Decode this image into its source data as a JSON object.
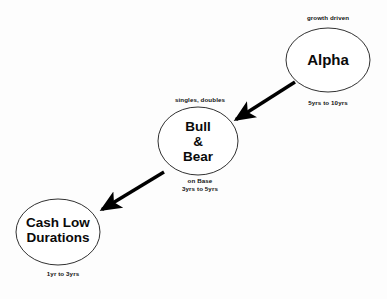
{
  "diagram": {
    "background_color": "#fdfdfd",
    "node_fill": "#ffffff",
    "node_stroke": "#1a1a1a",
    "edge_color": "#000000",
    "nodes": [
      {
        "id": "alpha",
        "label": "Alpha",
        "caption_above": "growth driven",
        "caption_below": "5yrs to 10yrs",
        "cx": 328,
        "cy": 60,
        "rx": 42,
        "ry": 32
      },
      {
        "id": "bull-bear",
        "label_line1": "Bull",
        "label_line2": "&",
        "label_line3": "Bear",
        "caption_above": "singles, doubles",
        "caption_below_line1": "on Base",
        "caption_below_line2": "3yrs to 5yrs",
        "cx": 198,
        "cy": 141,
        "rx": 40,
        "ry": 34
      },
      {
        "id": "cash-low-durations",
        "label_line1": "Cash Low",
        "label_line2": "Durations",
        "caption_below": "1yr to 3yrs",
        "cx": 58,
        "cy": 232,
        "rx": 42,
        "ry": 33
      }
    ],
    "edges": [
      {
        "id": "alpha-to-bull-bear",
        "from": "alpha",
        "to": "bull-bear",
        "x1": 295,
        "y1": 82,
        "x2": 233,
        "y2": 121
      },
      {
        "id": "bull-bear-to-cash",
        "from": "bull-bear",
        "to": "cash-low-durations",
        "x1": 164,
        "y1": 172,
        "x2": 99,
        "y2": 211
      }
    ]
  }
}
